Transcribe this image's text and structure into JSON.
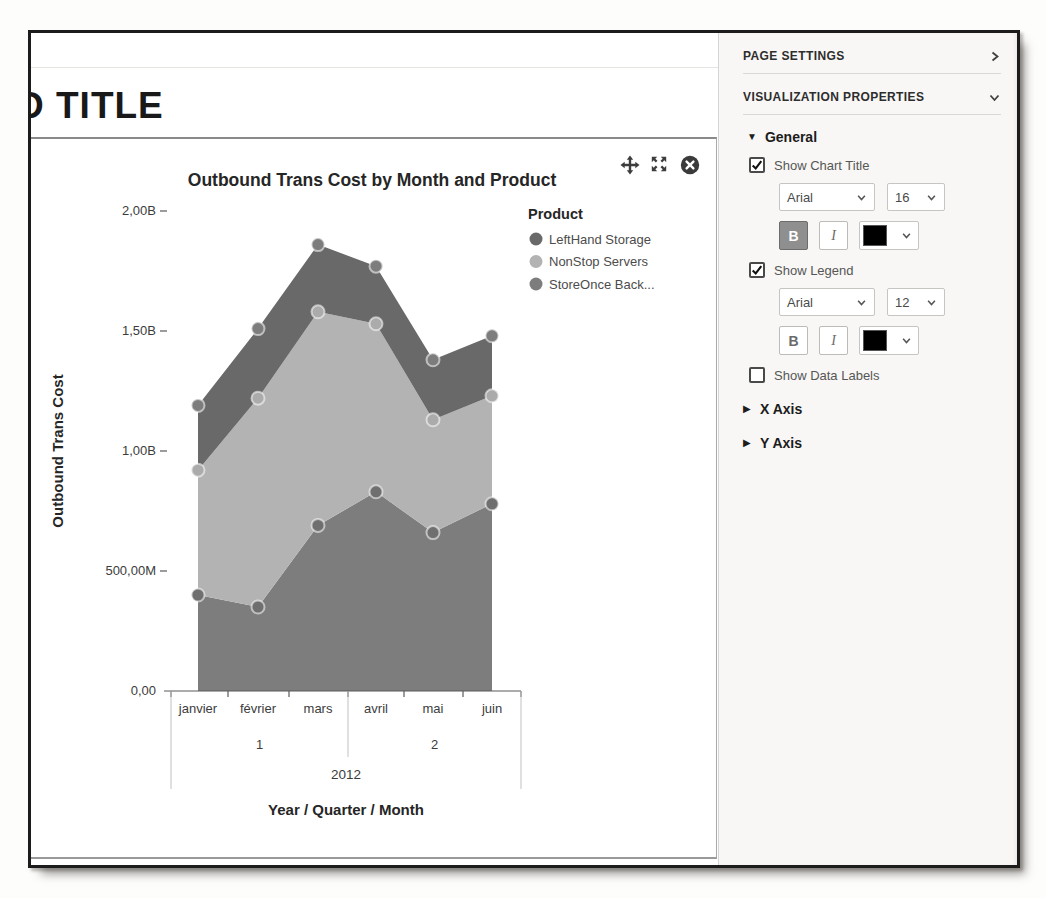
{
  "page": {
    "heading_clipped": "D TITLE"
  },
  "widget": {
    "controls": {
      "move": "move",
      "maximize": "maximize",
      "close": "close"
    }
  },
  "chart_data": {
    "type": "area",
    "stacked": true,
    "title": "Outbound Trans Cost by Month and Product",
    "xlabel": "Year / Quarter / Month",
    "ylabel": "Outbound Trans Cost",
    "categories": [
      "janvier",
      "février",
      "mars",
      "avril",
      "mai",
      "juin"
    ],
    "x_quarters": [
      {
        "label": "1",
        "from": 0,
        "to": 3
      },
      {
        "label": "2",
        "from": 3,
        "to": 6
      }
    ],
    "x_year": "2012",
    "y_ticks": [
      {
        "label": "2,00B",
        "value": 2000
      },
      {
        "label": "1,50B",
        "value": 1500
      },
      {
        "label": "1,00B",
        "value": 1000
      },
      {
        "label": "500,00M",
        "value": 500
      },
      {
        "label": "0,00",
        "value": 0
      }
    ],
    "y_unit_millions": true,
    "ylim": [
      0,
      2000
    ],
    "grid": false,
    "legend_title": "Product",
    "legend_position": "top-right",
    "series": [
      {
        "name": "LeftHand Storage",
        "color": "#696969",
        "marker_color": "#7d7d7d",
        "values_millions": [
          270,
          290,
          280,
          240,
          250,
          250
        ]
      },
      {
        "name": "NonStop Servers",
        "color": "#b3b3b3",
        "marker_color": "#ababab",
        "values_millions": [
          520,
          870,
          890,
          700,
          470,
          450
        ]
      },
      {
        "name": "StoreOnce Back...",
        "color": "#7d7d7d",
        "marker_color": "#6f6f6f",
        "values_millions": [
          400,
          350,
          690,
          830,
          660,
          780
        ]
      }
    ],
    "stack_order_bottom_to_top": [
      "StoreOnce Back...",
      "NonStop Servers",
      "LeftHand Storage"
    ],
    "cumulative_totals_millions": [
      1190,
      1510,
      1860,
      1770,
      1380,
      1480
    ]
  },
  "sidebar": {
    "page_settings_label": "PAGE SETTINGS",
    "viz_properties_label": "VISUALIZATION PROPERTIES",
    "general": {
      "label": "General",
      "show_chart_title": {
        "label": "Show Chart Title",
        "checked": true,
        "font_family": "Arial",
        "font_size": "16",
        "bold": true,
        "italic": false,
        "color": "#000000",
        "bold_glyph": "B",
        "italic_glyph": "I"
      },
      "show_legend": {
        "label": "Show Legend",
        "checked": true,
        "font_family": "Arial",
        "font_size": "12",
        "bold": false,
        "italic": false,
        "color": "#000000",
        "bold_glyph": "B",
        "italic_glyph": "I"
      },
      "show_data_labels": {
        "label": "Show Data Labels",
        "checked": false
      }
    },
    "x_axis_label": "X Axis",
    "y_axis_label": "Y Axis"
  }
}
